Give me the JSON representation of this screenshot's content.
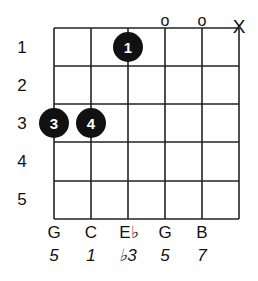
{
  "diagram": {
    "type": "guitar-chord-diagram",
    "strings_count": 6,
    "frets_count": 5,
    "fret_numbers": [
      "1",
      "2",
      "3",
      "4",
      "5"
    ],
    "string_markers": [
      {
        "string": 4,
        "symbol": "o",
        "meaning": "open"
      },
      {
        "string": 5,
        "symbol": "o",
        "meaning": "open"
      },
      {
        "string": 6,
        "symbol": "X",
        "meaning": "muted"
      }
    ],
    "fingers": [
      {
        "string": 3,
        "fret": 1,
        "finger": "1"
      },
      {
        "string": 1,
        "fret": 3,
        "finger": "3"
      },
      {
        "string": 2,
        "fret": 3,
        "finger": "4"
      }
    ],
    "notes": [
      "G",
      "C",
      "E♭",
      "G",
      "B"
    ],
    "intervals": [
      "5",
      "1",
      "♭3",
      "5",
      "7"
    ],
    "colors": {
      "grid": "#222222",
      "dot": "#111111",
      "dot_text": "#ffffff",
      "background": "#ffffff"
    }
  }
}
